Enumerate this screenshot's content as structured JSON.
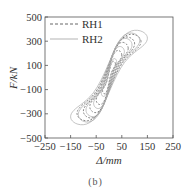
{
  "caption": "(b)",
  "chart_data": {
    "type": "line",
    "title": "",
    "xlabel": "Δ/mm",
    "ylabel": "F/kN",
    "xlim": [
      -250,
      250
    ],
    "ylim": [
      -500,
      500
    ],
    "xticks": [
      -250,
      -150,
      -50,
      50,
      150,
      250
    ],
    "yticks": [
      -500,
      -300,
      -100,
      100,
      300,
      500
    ],
    "xtick_labels": [
      "−250",
      "−150",
      "−50",
      "50",
      "150",
      "250"
    ],
    "ytick_labels": [
      "−500",
      "−300",
      "−100",
      "100",
      "300",
      "500"
    ],
    "grid": false,
    "legend_position": "upper left",
    "series": [
      {
        "name": "RH1",
        "style": "dashed",
        "color": "#555555",
        "loops": [
          {
            "amplitude": 25,
            "peak_force": 120
          },
          {
            "amplitude": 50,
            "peak_force": 200
          },
          {
            "amplitude": 75,
            "peak_force": 260
          },
          {
            "amplitude": 100,
            "peak_force": 300
          },
          {
            "amplitude": 125,
            "peak_force": 320
          }
        ]
      },
      {
        "name": "RH2",
        "style": "solid",
        "color": "#aaaaaa",
        "loops": [
          {
            "amplitude": 30,
            "peak_force": 140
          },
          {
            "amplitude": 60,
            "peak_force": 230
          },
          {
            "amplitude": 90,
            "peak_force": 290
          },
          {
            "amplitude": 120,
            "peak_force": 330
          },
          {
            "amplitude": 150,
            "peak_force": 350
          }
        ]
      }
    ]
  },
  "legend": {
    "items": [
      {
        "label": "RH1"
      },
      {
        "label": "RH2"
      }
    ]
  }
}
